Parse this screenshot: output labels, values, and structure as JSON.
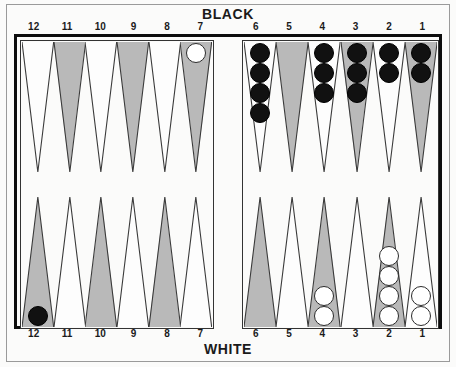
{
  "figure": {
    "title_top": "BLACK",
    "title_bottom": "WHITE",
    "colors": {
      "point_dark": "#b9b9b9",
      "point_light": "#fdfdfd",
      "board_background": "#fbfbfa",
      "frame": "#0d0d0d",
      "checker_black": "#111111",
      "checker_white": "#ffffff"
    }
  },
  "numbers": {
    "top_left": [
      "12",
      "11",
      "10",
      "9",
      "8",
      "7"
    ],
    "top_right": [
      "6",
      "5",
      "4",
      "3",
      "2",
      "1"
    ],
    "bottom_left": [
      "12",
      "11",
      "10",
      "9",
      "8",
      "7"
    ],
    "bottom_right": [
      "6",
      "5",
      "4",
      "3",
      "2",
      "1"
    ]
  },
  "board": {
    "top_left": [
      {
        "number": "12",
        "shade": "light",
        "checkers": 0,
        "color": "none"
      },
      {
        "number": "11",
        "shade": "dark",
        "checkers": 0,
        "color": "none"
      },
      {
        "number": "10",
        "shade": "light",
        "checkers": 0,
        "color": "none"
      },
      {
        "number": "9",
        "shade": "dark",
        "checkers": 0,
        "color": "none"
      },
      {
        "number": "8",
        "shade": "light",
        "checkers": 0,
        "color": "none"
      },
      {
        "number": "7",
        "shade": "dark",
        "checkers": 1,
        "color": "white"
      }
    ],
    "top_right": [
      {
        "number": "6",
        "shade": "light",
        "checkers": 4,
        "color": "black"
      },
      {
        "number": "5",
        "shade": "dark",
        "checkers": 0,
        "color": "none"
      },
      {
        "number": "4",
        "shade": "light",
        "checkers": 3,
        "color": "black"
      },
      {
        "number": "3",
        "shade": "dark",
        "checkers": 3,
        "color": "black"
      },
      {
        "number": "2",
        "shade": "light",
        "checkers": 2,
        "color": "black"
      },
      {
        "number": "1",
        "shade": "dark",
        "checkers": 2,
        "color": "black"
      }
    ],
    "bottom_left": [
      {
        "number": "12",
        "shade": "dark",
        "checkers": 1,
        "color": "black"
      },
      {
        "number": "11",
        "shade": "light",
        "checkers": 0,
        "color": "none"
      },
      {
        "number": "10",
        "shade": "dark",
        "checkers": 0,
        "color": "none"
      },
      {
        "number": "9",
        "shade": "light",
        "checkers": 0,
        "color": "none"
      },
      {
        "number": "8",
        "shade": "dark",
        "checkers": 0,
        "color": "none"
      },
      {
        "number": "7",
        "shade": "light",
        "checkers": 0,
        "color": "none"
      }
    ],
    "bottom_right": [
      {
        "number": "6",
        "shade": "dark",
        "checkers": 0,
        "color": "none"
      },
      {
        "number": "5",
        "shade": "light",
        "checkers": 0,
        "color": "none"
      },
      {
        "number": "4",
        "shade": "dark",
        "checkers": 2,
        "color": "white"
      },
      {
        "number": "3",
        "shade": "light",
        "checkers": 0,
        "color": "none"
      },
      {
        "number": "2",
        "shade": "dark",
        "checkers": 4,
        "color": "white"
      },
      {
        "number": "1",
        "shade": "light",
        "checkers": 2,
        "color": "white"
      }
    ]
  }
}
